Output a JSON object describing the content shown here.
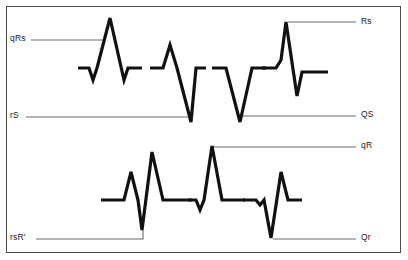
{
  "figure": {
    "background_color": "#ffffff",
    "frame_color": "#4a4a4a",
    "wave_color": "#111111",
    "leader_color": "#6b6b6b"
  },
  "labels": {
    "qrs_left": "qRs",
    "rs_left": "rS",
    "rs_right": "Rs",
    "qs_right": "QS",
    "rsr_left": "rsR'",
    "qr_right": "qR",
    "qr_right2": "Qr"
  },
  "chart_data": {
    "type": "line",
    "xlabel": "",
    "ylabel": "",
    "grid": false,
    "legend": "none",
    "xlim": [
      0,
      408
    ],
    "ylim": [
      260,
      0
    ],
    "annotations": [
      {
        "name": "qRs",
        "text": "qRs",
        "x": 10,
        "y": 40,
        "anchor": "start"
      },
      {
        "name": "rS",
        "text": "rS",
        "x": 10,
        "y": 117,
        "anchor": "start"
      },
      {
        "name": "Rs",
        "text": "Rs",
        "x": 360,
        "y": 24,
        "anchor": "start"
      },
      {
        "name": "QS",
        "text": "QS",
        "x": 360,
        "y": 116,
        "anchor": "start"
      },
      {
        "name": "qR",
        "text": "qR",
        "x": 360,
        "y": 148,
        "anchor": "start"
      },
      {
        "name": "rsR'",
        "text": "rsR'",
        "x": 10,
        "y": 239,
        "anchor": "start"
      },
      {
        "name": "Qr",
        "text": "Qr",
        "x": 360,
        "y": 240,
        "anchor": "start"
      }
    ],
    "series": [
      {
        "name": "qRs",
        "row": "top",
        "baseline_y": 68,
        "points": [
          [
            78,
            68
          ],
          [
            89,
            68
          ],
          [
            93,
            80
          ],
          [
            97,
            68
          ],
          [
            110,
            18
          ],
          [
            124,
            80
          ],
          [
            128,
            68
          ],
          [
            142,
            68
          ]
        ]
      },
      {
        "name": "rS",
        "row": "top",
        "baseline_y": 68,
        "points": [
          [
            150,
            68
          ],
          [
            163,
            68
          ],
          [
            170,
            45
          ],
          [
            177,
            68
          ],
          [
            191,
            122
          ],
          [
            196,
            68
          ],
          [
            206,
            68
          ]
        ]
      },
      {
        "name": "QS",
        "row": "top",
        "baseline_y": 68,
        "points": [
          [
            212,
            68
          ],
          [
            222,
            68
          ],
          [
            226,
            68
          ],
          [
            240,
            122
          ],
          [
            252,
            68
          ],
          [
            266,
            68
          ]
        ]
      },
      {
        "name": "Rs",
        "row": "top",
        "baseline_y": 68,
        "points": [
          [
            262,
            68
          ],
          [
            276,
            68
          ],
          [
            281,
            60
          ],
          [
            286,
            22
          ],
          [
            297,
            96
          ],
          [
            302,
            72
          ],
          [
            305,
            72
          ],
          [
            328,
            72
          ]
        ]
      },
      {
        "name": "rsR'",
        "row": "bottom",
        "baseline_y": 200,
        "points": [
          [
            101,
            200
          ],
          [
            124,
            200
          ],
          [
            131,
            172
          ],
          [
            138,
            200
          ],
          [
            142,
            230
          ],
          [
            152,
            152
          ],
          [
            163,
            200
          ],
          [
            170,
            200
          ],
          [
            192,
            200
          ]
        ]
      },
      {
        "name": "qR",
        "row": "bottom",
        "baseline_y": 200,
        "points": [
          [
            188,
            200
          ],
          [
            196,
            200
          ],
          [
            200,
            210
          ],
          [
            204,
            200
          ],
          [
            212,
            146
          ],
          [
            222,
            200
          ],
          [
            229,
            200
          ],
          [
            245,
            200
          ]
        ]
      },
      {
        "name": "Qr",
        "row": "bottom",
        "baseline_y": 200,
        "points": [
          [
            243,
            200
          ],
          [
            256,
            200
          ],
          [
            260,
            205
          ],
          [
            264,
            200
          ],
          [
            271,
            238
          ],
          [
            281,
            172
          ],
          [
            288,
            200
          ],
          [
            302,
            200
          ]
        ]
      }
    ],
    "leaders": [
      {
        "name": "qRs-leader",
        "points": [
          [
            31,
            40
          ],
          [
            103,
            40
          ]
        ]
      },
      {
        "name": "rS-leader",
        "points": [
          [
            26,
            117
          ],
          [
            190,
            117
          ]
        ]
      },
      {
        "name": "Rs-leader",
        "points": [
          [
            288,
            22
          ],
          [
            356,
            22
          ]
        ]
      },
      {
        "name": "QS-leader",
        "points": [
          [
            243,
            116
          ],
          [
            356,
            116
          ]
        ]
      },
      {
        "name": "qR-leader",
        "points": [
          [
            213,
            147
          ],
          [
            356,
            147
          ]
        ]
      },
      {
        "name": "rsR-leader",
        "points": [
          [
            36,
            239
          ],
          [
            143,
            239
          ],
          [
            143,
            230
          ]
        ]
      },
      {
        "name": "Qr-leader",
        "points": [
          [
            273,
            239
          ],
          [
            356,
            239
          ]
        ]
      }
    ]
  }
}
